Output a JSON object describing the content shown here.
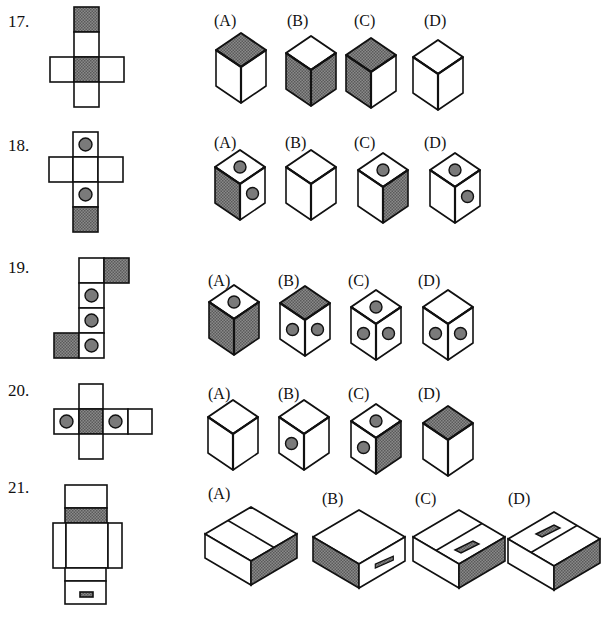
{
  "colors": {
    "ink": "#111111",
    "shade": "#6f6f6f",
    "paper": "#ffffff",
    "dot": "#7a7a7a"
  },
  "problems": [
    {
      "number": "17.",
      "num_pos": [
        8,
        12
      ],
      "net": [
        {
          "x": 74,
          "y": 7,
          "w": 25,
          "h": 25,
          "fill": "shade"
        },
        {
          "x": 74,
          "y": 32,
          "w": 25,
          "h": 25
        },
        {
          "x": 50,
          "y": 57,
          "w": 24,
          "h": 25
        },
        {
          "x": 74,
          "y": 57,
          "w": 25,
          "h": 25,
          "fill": "shade"
        },
        {
          "x": 99,
          "y": 57,
          "w": 25,
          "h": 25
        },
        {
          "x": 74,
          "y": 82,
          "w": 25,
          "h": 25
        }
      ],
      "options": [
        {
          "label": "(A)",
          "lx": 214,
          "ly": 12,
          "cx": 241,
          "cy": 33,
          "faces": {
            "top": "shade",
            "left": "white",
            "right": "white"
          },
          "dots": {}
        },
        {
          "label": "(B)",
          "lx": 287,
          "ly": 12,
          "cx": 311,
          "cy": 36,
          "faces": {
            "top": "white",
            "left": "shade",
            "right": "shade"
          },
          "dots": {}
        },
        {
          "label": "(C)",
          "lx": 354,
          "ly": 12,
          "cx": 371,
          "cy": 38,
          "faces": {
            "top": "shade",
            "left": "shade",
            "right": "white"
          },
          "dots": {}
        },
        {
          "label": "(D)",
          "lx": 424,
          "ly": 12,
          "cx": 438,
          "cy": 40,
          "faces": {
            "top": "white",
            "left": "white",
            "right": "white"
          },
          "dots": {}
        }
      ]
    },
    {
      "number": "18.",
      "num_pos": [
        8,
        136
      ],
      "net": [
        {
          "x": 73,
          "y": 132,
          "w": 25,
          "h": 25,
          "dot": true
        },
        {
          "x": 49,
          "y": 157,
          "w": 24,
          "h": 25
        },
        {
          "x": 73,
          "y": 157,
          "w": 25,
          "h": 25
        },
        {
          "x": 98,
          "y": 157,
          "w": 25,
          "h": 25
        },
        {
          "x": 73,
          "y": 182,
          "w": 25,
          "h": 25,
          "dot": true
        },
        {
          "x": 73,
          "y": 207,
          "w": 25,
          "h": 25,
          "fill": "shade"
        }
      ],
      "options": [
        {
          "label": "(A)",
          "lx": 214,
          "ly": 134,
          "cx": 240,
          "cy": 150,
          "faces": {
            "top": "white",
            "left": "shade",
            "right": "white"
          },
          "dots": {
            "top": 1,
            "right": 1
          }
        },
        {
          "label": "(B)",
          "lx": 285,
          "ly": 134,
          "cx": 311,
          "cy": 150,
          "faces": {
            "top": "white",
            "left": "white",
            "right": "white"
          },
          "dots": {}
        },
        {
          "label": "(C)",
          "lx": 354,
          "ly": 134,
          "cx": 383,
          "cy": 153,
          "faces": {
            "top": "white",
            "left": "white",
            "right": "shade"
          },
          "dots": {
            "top": 1
          }
        },
        {
          "label": "(D)",
          "lx": 424,
          "ly": 134,
          "cx": 455,
          "cy": 153,
          "faces": {
            "top": "white",
            "left": "white",
            "right": "white"
          },
          "dots": {
            "top": 1,
            "right": 1
          }
        }
      ]
    },
    {
      "number": "19.",
      "num_pos": [
        8,
        258
      ],
      "net": [
        {
          "x": 79,
          "y": 258,
          "w": 25,
          "h": 25
        },
        {
          "x": 104,
          "y": 258,
          "w": 25,
          "h": 25,
          "fill": "shade"
        },
        {
          "x": 79,
          "y": 283,
          "w": 25,
          "h": 25,
          "dot": true
        },
        {
          "x": 79,
          "y": 308,
          "w": 25,
          "h": 25,
          "dot": true
        },
        {
          "x": 54,
          "y": 333,
          "w": 25,
          "h": 25,
          "fill": "shade"
        },
        {
          "x": 79,
          "y": 333,
          "w": 25,
          "h": 25,
          "dot": true
        }
      ],
      "options": [
        {
          "label": "(A)",
          "lx": 208,
          "ly": 272,
          "cx": 234,
          "cy": 285,
          "faces": {
            "top": "white",
            "left": "shade",
            "right": "shade"
          },
          "dots": {
            "top": 1
          }
        },
        {
          "label": "(B)",
          "lx": 278,
          "ly": 272,
          "cx": 305,
          "cy": 286,
          "faces": {
            "top": "shade",
            "left": "white",
            "right": "white"
          },
          "dots": {
            "left": 1,
            "right": 1
          }
        },
        {
          "label": "(C)",
          "lx": 348,
          "ly": 272,
          "cx": 376,
          "cy": 290,
          "faces": {
            "top": "white",
            "left": "white",
            "right": "white"
          },
          "dots": {
            "top": 1,
            "left": 1,
            "right": 1
          }
        },
        {
          "label": "(D)",
          "lx": 418,
          "ly": 272,
          "cx": 448,
          "cy": 290,
          "faces": {
            "top": "white",
            "left": "white",
            "right": "white"
          },
          "dots": {
            "left": 1,
            "right": 1
          }
        }
      ]
    },
    {
      "number": "20.",
      "num_pos": [
        8,
        381
      ],
      "net": [
        {
          "x": 79,
          "y": 384,
          "w": 24,
          "h": 25
        },
        {
          "x": 54,
          "y": 409,
          "w": 25,
          "h": 25,
          "dot": true
        },
        {
          "x": 79,
          "y": 409,
          "w": 24,
          "h": 25,
          "fill": "shade"
        },
        {
          "x": 103,
          "y": 409,
          "w": 25,
          "h": 25,
          "dot": true
        },
        {
          "x": 128,
          "y": 409,
          "w": 24,
          "h": 25
        },
        {
          "x": 79,
          "y": 434,
          "w": 24,
          "h": 25
        }
      ],
      "options": [
        {
          "label": "(A)",
          "lx": 208,
          "ly": 385,
          "cx": 233,
          "cy": 400,
          "faces": {
            "top": "white",
            "left": "white",
            "right": "white"
          },
          "dots": {}
        },
        {
          "label": "(B)",
          "lx": 278,
          "ly": 385,
          "cx": 304,
          "cy": 400,
          "faces": {
            "top": "white",
            "left": "white",
            "right": "white"
          },
          "dots": {
            "left": 1
          }
        },
        {
          "label": "(C)",
          "lx": 348,
          "ly": 385,
          "cx": 376,
          "cy": 404,
          "faces": {
            "top": "white",
            "left": "white",
            "right": "shade"
          },
          "dots": {
            "top": 1,
            "left": 1
          }
        },
        {
          "label": "(D)",
          "lx": 418,
          "ly": 385,
          "cx": 448,
          "cy": 406,
          "faces": {
            "top": "shade",
            "left": "white",
            "right": "white"
          },
          "dots": {}
        }
      ]
    },
    {
      "number": "21.",
      "num_pos": [
        8,
        478
      ],
      "net": [
        {
          "x": 65,
          "y": 485,
          "w": 42,
          "h": 23
        },
        {
          "x": 65,
          "y": 508,
          "w": 42,
          "h": 15,
          "fill": "shade"
        },
        {
          "x": 53,
          "y": 523,
          "w": 13,
          "h": 45
        },
        {
          "x": 66,
          "y": 523,
          "w": 42,
          "h": 45
        },
        {
          "x": 108,
          "y": 523,
          "w": 14,
          "h": 45
        },
        {
          "x": 65,
          "y": 568,
          "w": 41,
          "h": 13
        },
        {
          "x": 65,
          "y": 581,
          "w": 41,
          "h": 23
        },
        {
          "x": 80,
          "y": 592,
          "w": 13,
          "h": 5,
          "fill": "shade"
        }
      ],
      "options": [
        {
          "label": "(A)",
          "lx": 208,
          "ly": 485,
          "variant": "A",
          "x": 251,
          "y": 507
        },
        {
          "label": "(B)",
          "lx": 322,
          "ly": 490,
          "variant": "B",
          "x": 359,
          "y": 510
        },
        {
          "label": "(C)",
          "lx": 415,
          "ly": 490,
          "variant": "C",
          "x": 459,
          "y": 510
        },
        {
          "label": "(D)",
          "lx": 508,
          "ly": 490,
          "variant": "D",
          "x": 554,
          "y": 512
        }
      ]
    }
  ]
}
